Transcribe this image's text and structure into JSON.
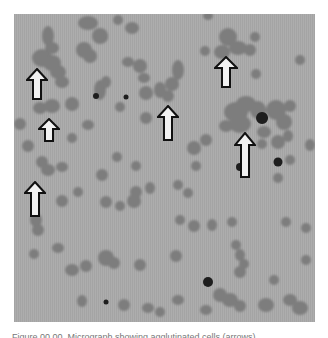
{
  "figure": {
    "background_color": "#a9a9a9",
    "cell_color": "#7c7c7c",
    "dark_cell_color": "#1e1e1e",
    "arrow_fill": "#f2f2f2",
    "arrow_stroke": "#111111",
    "arrows": [
      {
        "id": "arrow-1",
        "x": 26,
        "y": 67
      },
      {
        "id": "arrow-2",
        "x": 38,
        "y": 118
      },
      {
        "id": "arrow-3",
        "x": 24,
        "y": 181
      },
      {
        "id": "arrow-4",
        "x": 157,
        "y": 104
      },
      {
        "id": "arrow-5",
        "x": 214,
        "y": 55
      },
      {
        "id": "arrow-6",
        "x": 234,
        "y": 132
      }
    ]
  },
  "caption": {
    "text": "Figure 00.00. Micrograph showing agglutinated cells (arrows)."
  }
}
